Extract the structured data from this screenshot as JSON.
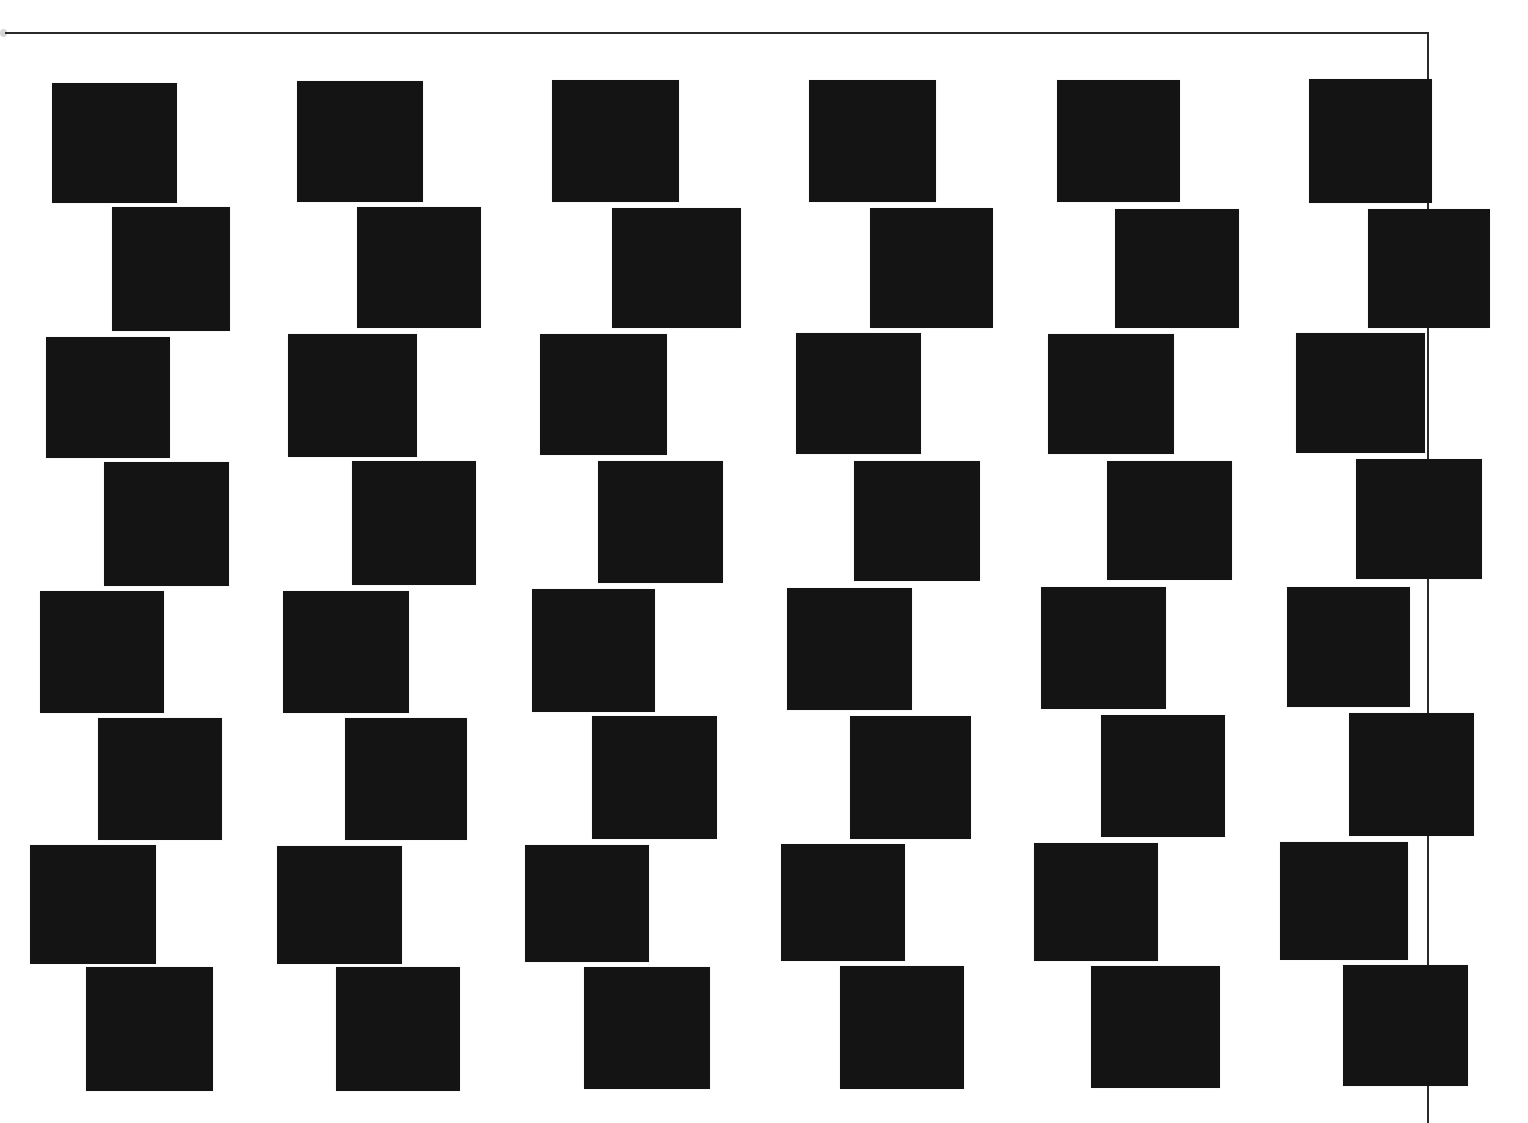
{
  "composition": {
    "title": "",
    "background_color": "#ffffff",
    "square_color": "#141414",
    "frame_color": "#2a2a2a",
    "grid": {
      "columns": 6,
      "rows": 8
    },
    "frame": {
      "top_line": {
        "x": 5,
        "y": 32,
        "width": 1424
      },
      "right_line": {
        "x": 1427,
        "y": 32,
        "height": 1091
      }
    },
    "rows": [
      {
        "row": 1,
        "squares": [
          {
            "x": 52,
            "y": 83,
            "w": 125,
            "h": 120
          },
          {
            "x": 297,
            "y": 81,
            "w": 126,
            "h": 121
          },
          {
            "x": 552,
            "y": 80,
            "w": 127,
            "h": 122
          },
          {
            "x": 809,
            "y": 80,
            "w": 127,
            "h": 122
          },
          {
            "x": 1057,
            "y": 80,
            "w": 123,
            "h": 122
          },
          {
            "x": 1309,
            "y": 79,
            "w": 123,
            "h": 124
          }
        ]
      },
      {
        "row": 2,
        "squares": [
          {
            "x": 112,
            "y": 207,
            "w": 118,
            "h": 124
          },
          {
            "x": 357,
            "y": 207,
            "w": 124,
            "h": 121
          },
          {
            "x": 612,
            "y": 208,
            "w": 129,
            "h": 120
          },
          {
            "x": 870,
            "y": 208,
            "w": 123,
            "h": 120
          },
          {
            "x": 1115,
            "y": 209,
            "w": 124,
            "h": 119
          },
          {
            "x": 1368,
            "y": 209,
            "w": 122,
            "h": 119
          }
        ]
      },
      {
        "row": 3,
        "squares": [
          {
            "x": 46,
            "y": 337,
            "w": 124,
            "h": 121
          },
          {
            "x": 288,
            "y": 334,
            "w": 129,
            "h": 123
          },
          {
            "x": 540,
            "y": 334,
            "w": 127,
            "h": 121
          },
          {
            "x": 796,
            "y": 333,
            "w": 125,
            "h": 121
          },
          {
            "x": 1048,
            "y": 334,
            "w": 126,
            "h": 120
          },
          {
            "x": 1296,
            "y": 333,
            "w": 129,
            "h": 120
          }
        ]
      },
      {
        "row": 4,
        "squares": [
          {
            "x": 104,
            "y": 462,
            "w": 125,
            "h": 124
          },
          {
            "x": 352,
            "y": 461,
            "w": 124,
            "h": 124
          },
          {
            "x": 598,
            "y": 461,
            "w": 125,
            "h": 122
          },
          {
            "x": 854,
            "y": 461,
            "w": 126,
            "h": 120
          },
          {
            "x": 1107,
            "y": 461,
            "w": 125,
            "h": 119
          },
          {
            "x": 1356,
            "y": 459,
            "w": 126,
            "h": 120
          }
        ]
      },
      {
        "row": 5,
        "squares": [
          {
            "x": 40,
            "y": 591,
            "w": 124,
            "h": 122
          },
          {
            "x": 283,
            "y": 591,
            "w": 126,
            "h": 122
          },
          {
            "x": 532,
            "y": 589,
            "w": 123,
            "h": 123
          },
          {
            "x": 787,
            "y": 588,
            "w": 125,
            "h": 122
          },
          {
            "x": 1041,
            "y": 587,
            "w": 125,
            "h": 122
          },
          {
            "x": 1287,
            "y": 587,
            "w": 123,
            "h": 120
          }
        ]
      },
      {
        "row": 6,
        "squares": [
          {
            "x": 98,
            "y": 718,
            "w": 124,
            "h": 122
          },
          {
            "x": 345,
            "y": 718,
            "w": 122,
            "h": 122
          },
          {
            "x": 592,
            "y": 716,
            "w": 125,
            "h": 123
          },
          {
            "x": 850,
            "y": 716,
            "w": 121,
            "h": 123
          },
          {
            "x": 1101,
            "y": 715,
            "w": 124,
            "h": 122
          },
          {
            "x": 1349,
            "y": 713,
            "w": 125,
            "h": 123
          }
        ]
      },
      {
        "row": 7,
        "squares": [
          {
            "x": 30,
            "y": 845,
            "w": 126,
            "h": 119
          },
          {
            "x": 277,
            "y": 846,
            "w": 125,
            "h": 118
          },
          {
            "x": 525,
            "y": 845,
            "w": 124,
            "h": 117
          },
          {
            "x": 781,
            "y": 844,
            "w": 124,
            "h": 117
          },
          {
            "x": 1034,
            "y": 843,
            "w": 124,
            "h": 118
          },
          {
            "x": 1280,
            "y": 842,
            "w": 128,
            "h": 118
          }
        ]
      },
      {
        "row": 8,
        "squares": [
          {
            "x": 86,
            "y": 967,
            "w": 127,
            "h": 124
          },
          {
            "x": 336,
            "y": 967,
            "w": 124,
            "h": 124
          },
          {
            "x": 584,
            "y": 967,
            "w": 126,
            "h": 122
          },
          {
            "x": 840,
            "y": 966,
            "w": 124,
            "h": 123
          },
          {
            "x": 1091,
            "y": 966,
            "w": 129,
            "h": 122
          },
          {
            "x": 1343,
            "y": 965,
            "w": 125,
            "h": 121
          }
        ]
      }
    ]
  }
}
